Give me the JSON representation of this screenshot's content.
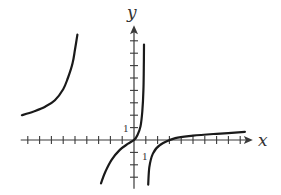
{
  "chart_data": {
    "type": "line",
    "title": "",
    "xlabel": "x",
    "ylabel": "y",
    "x_tick_label": "1",
    "y_tick_label": "1",
    "xlim": [
      -9.6,
      9.9
    ],
    "ylim": [
      -3.6,
      8.6
    ],
    "x_ticks": [
      -9,
      -8,
      -7,
      -6,
      -5,
      -4,
      -3,
      -2,
      -1,
      1,
      2,
      3,
      4,
      5,
      6,
      7,
      8,
      9
    ],
    "y_ticks": [
      -3,
      -2,
      -1,
      1,
      2,
      3,
      4,
      5,
      6,
      7,
      8
    ],
    "grid": false,
    "legend": "none",
    "series": [
      {
        "name": "left-branch",
        "points": [
          [
            -9.5,
            2.0
          ],
          [
            -8.5,
            2.3
          ],
          [
            -7.5,
            2.7
          ],
          [
            -6.7,
            3.2
          ],
          [
            -6.0,
            4.1
          ],
          [
            -5.6,
            5.0
          ],
          [
            -5.2,
            6.2
          ],
          [
            -5.0,
            7.3
          ],
          [
            -4.8,
            8.5
          ]
        ]
      },
      {
        "name": "middle-branch",
        "points": [
          [
            -2.8,
            -3.5
          ],
          [
            -2.4,
            -2.5
          ],
          [
            -1.9,
            -1.6
          ],
          [
            -1.2,
            -0.8
          ],
          [
            -0.5,
            -0.3
          ],
          [
            0,
            0
          ],
          [
            0.3,
            0.4
          ],
          [
            0.55,
            1.1
          ],
          [
            0.7,
            2.3
          ],
          [
            0.8,
            4.0
          ],
          [
            0.83,
            5.8
          ],
          [
            0.85,
            7.7
          ]
        ]
      },
      {
        "name": "right-branch",
        "points": [
          [
            1.2,
            -3.6
          ],
          [
            1.3,
            -2.2
          ],
          [
            1.6,
            -1.1
          ],
          [
            2.2,
            -0.4
          ],
          [
            3.5,
            0.15
          ],
          [
            5.0,
            0.35
          ],
          [
            7.0,
            0.5
          ],
          [
            9.4,
            0.65
          ]
        ]
      }
    ]
  }
}
